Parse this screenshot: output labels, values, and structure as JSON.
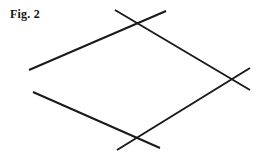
{
  "figure": {
    "caption": "Fig. 2",
    "background_color": "#ffffff",
    "stroke_color": "#1a1a1a",
    "stroke_width": 2,
    "canvas": {
      "width": 268,
      "height": 157
    },
    "shape_name": "rhombus-with-extended-sides",
    "vertices": [
      {
        "name": "top",
        "x": 140,
        "y": 30
      },
      {
        "name": "right",
        "x": 231,
        "y": 78
      },
      {
        "name": "bottom",
        "x": 140,
        "y": 135
      },
      {
        "name": "left",
        "x": 42,
        "y": 80
      }
    ],
    "segments": [
      {
        "name": "upper-left-side",
        "description": "line from upper-left overshoot through left vertex to top vertex and beyond",
        "x1": 29,
        "y1": 70,
        "x2": 166,
        "y2": 11
      },
      {
        "name": "upper-right-side",
        "description": "line from top overshoot through top vertex down to right vertex and beyond",
        "x1": 115,
        "y1": 10,
        "x2": 250,
        "y2": 90
      },
      {
        "name": "lower-right-side",
        "description": "line from upper-right overshoot through right vertex down to bottom vertex and beyond",
        "x1": 250,
        "y1": 68,
        "x2": 117,
        "y2": 150
      },
      {
        "name": "lower-left-side",
        "description": "line from lower-left overshoot through left vertex down to bottom vertex and beyond",
        "x1": 33,
        "y1": 92,
        "x2": 160,
        "y2": 148
      }
    ]
  }
}
